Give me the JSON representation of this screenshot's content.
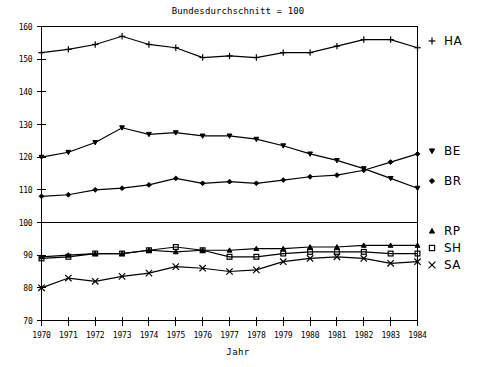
{
  "chart_data": {
    "type": "line",
    "title": "Bundesdurchschnitt = 100",
    "xlabel": "Jahr",
    "ylabel": "",
    "x": [
      1970,
      1971,
      1972,
      1973,
      1974,
      1975,
      1976,
      1977,
      1978,
      1979,
      1980,
      1981,
      1982,
      1983,
      1984
    ],
    "xticklabels": [
      "1970",
      "1971",
      "1972",
      "1973",
      "1974",
      "1975",
      "1976",
      "1977",
      "1978",
      "1979",
      "1980",
      "1981",
      "1982",
      "1983",
      "1984"
    ],
    "yticklabels": [
      "70",
      "80",
      "90",
      "100",
      "110",
      "120",
      "130",
      "140",
      "150",
      "160"
    ],
    "ylim": [
      70,
      160
    ],
    "xlim": [
      1970,
      1984
    ],
    "grid": false,
    "legend_position": "right",
    "series": [
      {
        "name": "HA",
        "marker": "plus",
        "values": [
          152,
          153,
          154.5,
          157,
          154.5,
          153.5,
          150.5,
          151,
          150.5,
          152,
          152,
          154,
          156,
          156,
          153.5
        ]
      },
      {
        "name": "BE",
        "marker": "triangle-down",
        "values": [
          120,
          121.5,
          124.5,
          129,
          127,
          127.5,
          126.5,
          126.5,
          125.5,
          123.5,
          121,
          119,
          116.5,
          113.5,
          110.5
        ]
      },
      {
        "name": "BR",
        "marker": "diamond",
        "values": [
          108,
          108.5,
          110,
          110.5,
          111.5,
          113.5,
          112,
          112.5,
          112,
          113,
          114,
          114.5,
          116,
          118.5,
          121
        ]
      },
      {
        "name": "RP",
        "marker": "triangle-up",
        "values": [
          89.5,
          90,
          90.5,
          90.5,
          91.5,
          91,
          91.5,
          91.5,
          92,
          92,
          92.5,
          92.5,
          93,
          93,
          93
        ]
      },
      {
        "name": "SH",
        "marker": "square",
        "values": [
          89,
          89.5,
          90.5,
          90.5,
          91.5,
          92.5,
          91.5,
          89.5,
          89.5,
          90.5,
          91,
          91,
          91,
          90.5,
          90.5
        ]
      },
      {
        "name": "SA",
        "marker": "cross",
        "values": [
          80,
          83,
          82,
          83.5,
          84.5,
          86.5,
          86,
          85,
          85.5,
          88,
          89,
          89.5,
          89,
          87.5,
          88
        ]
      }
    ],
    "separator_at": 100
  },
  "legend": {
    "entries": [
      {
        "label": "HA",
        "marker": "plus"
      },
      {
        "label": "BE",
        "marker": "triangle-down"
      },
      {
        "label": "BR",
        "marker": "diamond"
      },
      {
        "label": "RP",
        "marker": "triangle-up"
      },
      {
        "label": "SH",
        "marker": "square"
      },
      {
        "label": "SA",
        "marker": "cross"
      }
    ]
  }
}
